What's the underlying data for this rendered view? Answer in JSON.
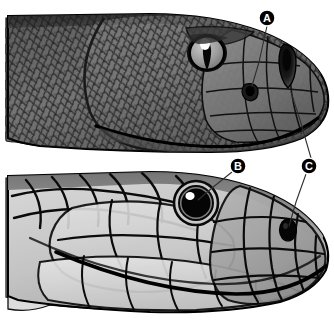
{
  "figure": {
    "name": "snake-head-comparison",
    "background_color": "#ffffff",
    "width": 334,
    "height": 322
  },
  "panels": [
    {
      "id": "upper",
      "name": "viper-head",
      "description": "Upper snake head in left-facing lateral view with small keeled scales, vertical slit pupil and a loreal heat-sensing pit",
      "eye_pupil": "vertical-slit",
      "scale_type": "small-keeled",
      "tone_dark": "#4a4a4a",
      "tone_mid": "#6e6e6e",
      "tone_light": "#8e8e8e"
    },
    {
      "id": "lower",
      "name": "colubrid-head",
      "description": "Lower snake head in left-facing lateral view with large smooth plate scales and a round pupil",
      "eye_pupil": "round",
      "scale_type": "large-smooth-plates",
      "tone_dark": "#7d7d7d",
      "tone_mid": "#a9a9a9",
      "tone_light": "#d2d2d2"
    }
  ],
  "labels": [
    {
      "id": "A",
      "text": "A",
      "name": "label-a",
      "target": "loreal-heat-pit",
      "marker": {
        "cx": 267,
        "cy": 18,
        "r": 8
      },
      "leader": [
        [
          267,
          26
        ],
        [
          259,
          62
        ],
        [
          253,
          88
        ]
      ]
    },
    {
      "id": "B",
      "text": "B",
      "name": "label-b",
      "target": "round-pupil-eye",
      "marker": {
        "cx": 238,
        "cy": 166,
        "r": 8
      },
      "leader": [
        [
          232,
          172
        ],
        [
          210,
          190
        ],
        [
          196,
          202
        ]
      ]
    },
    {
      "id": "C",
      "text": "C",
      "name": "label-c",
      "target": "nostril",
      "marker": {
        "cx": 309,
        "cy": 166,
        "r": 8
      },
      "leader_up": [
        [
          311,
          158
        ],
        [
          300,
          120
        ],
        [
          289,
          92
        ]
      ],
      "leader_down": [
        [
          305,
          174
        ],
        [
          294,
          202
        ],
        [
          287,
          228
        ]
      ]
    }
  ],
  "colors": {
    "outline": "#000000",
    "label_fill": "#000000",
    "label_text": "#ffffff",
    "leader_line": "#3a3a3a",
    "background": "#ffffff"
  }
}
